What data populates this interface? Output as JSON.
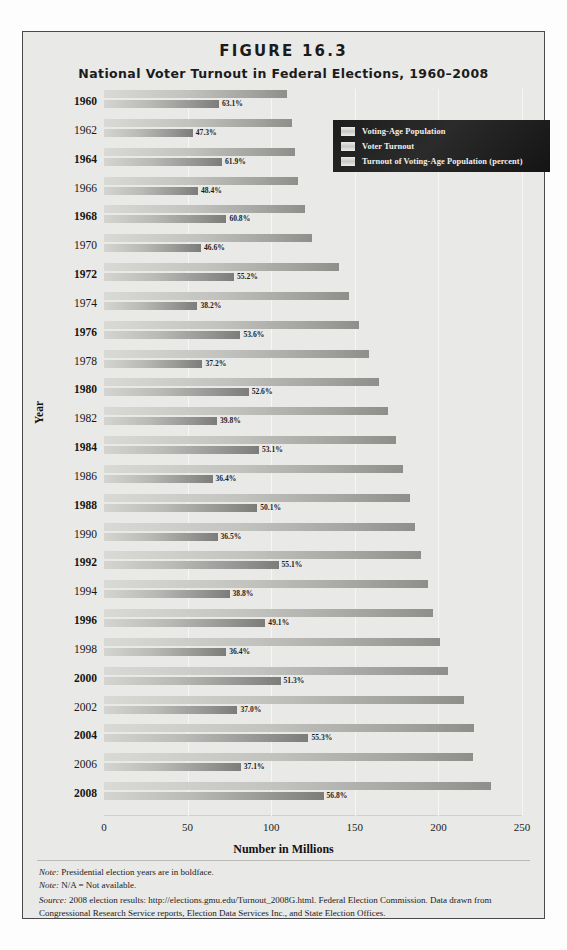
{
  "figure": {
    "number": "FIGURE 16.3",
    "title": "National Voter Turnout in Federal Elections, 1960–2008"
  },
  "axes": {
    "xlabel": "Number in Millions",
    "ylabel": "Year",
    "xticks": [
      "0",
      "50",
      "100",
      "150",
      "200",
      "250"
    ]
  },
  "legend": {
    "items": [
      {
        "label": "Voting-Age Population"
      },
      {
        "label": "Voter Turnout"
      },
      {
        "label": "Turnout of Voting-Age Population (percent)"
      }
    ]
  },
  "notes": {
    "note1_prefix": "Note:",
    "note1": " Presidential election years are in boldface.",
    "note2_prefix": "Note:",
    "note2": " N/A = Not available.",
    "source_prefix": "Source:",
    "source": " 2008 election results: http://elections.gmu.edu/Turnout_2008G.html. Federal Election Commission. Data drawn from Congressional Research Service reports, Election Data Services Inc., and State Election Offices."
  },
  "chart_data": {
    "type": "bar",
    "title": "National Voter Turnout in Federal Elections, 1960–2008",
    "xlabel": "Number in Millions",
    "ylabel": "Year",
    "xlim": [
      0,
      250
    ],
    "grid": true,
    "orientation": "horizontal",
    "legend_position": "top-right",
    "categories": [
      "1960",
      "1962",
      "1964",
      "1966",
      "1968",
      "1970",
      "1972",
      "1974",
      "1976",
      "1978",
      "1980",
      "1982",
      "1984",
      "1986",
      "1988",
      "1990",
      "1992",
      "1994",
      "1996",
      "1998",
      "2000",
      "2002",
      "2004",
      "2006",
      "2008"
    ],
    "presidential_years": [
      "1960",
      "1964",
      "1968",
      "1972",
      "1976",
      "1980",
      "1984",
      "1988",
      "1992",
      "1996",
      "2000",
      "2004",
      "2008"
    ],
    "series": [
      {
        "name": "Voting-Age Population",
        "unit": "millions",
        "values": [
          109.7,
          112.4,
          114.1,
          116.1,
          120.3,
          124.5,
          140.8,
          146.3,
          152.3,
          158.4,
          164.6,
          169.9,
          174.5,
          178.6,
          182.8,
          185.8,
          189.5,
          193.7,
          196.5,
          200.9,
          205.8,
          215.5,
          221.3,
          220.6,
          231.2
        ]
      },
      {
        "name": "Voter Turnout",
        "unit": "millions",
        "values": [
          68.8,
          53.1,
          70.6,
          56.2,
          73.2,
          58.0,
          77.7,
          55.9,
          81.6,
          58.9,
          86.5,
          67.6,
          92.7,
          64.9,
          91.6,
          67.9,
          104.4,
          75.1,
          96.5,
          73.1,
          105.6,
          79.8,
          122.3,
          81.8,
          131.3
        ]
      }
    ],
    "percent_labels": [
      "63.1%",
      "47.3%",
      "61.9%",
      "48.4%",
      "60.8%",
      "46.6%",
      "55.2%",
      "38.2%",
      "53.6%",
      "37.2%",
      "52.6%",
      "39.8%",
      "53.1%",
      "36.4%",
      "50.1%",
      "36.5%",
      "55.1%",
      "38.8%",
      "49.1%",
      "36.4%",
      "51.3%",
      "37.0%",
      "55.3%",
      "37.1%",
      "56.8%"
    ]
  }
}
